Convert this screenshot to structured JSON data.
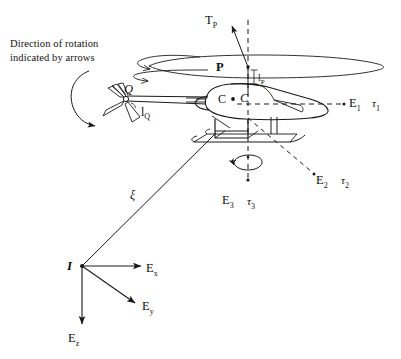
{
  "figure": {
    "title_note_line1": "Direction of rotation",
    "title_note_line2": "indicated by arrows",
    "background_color": "#ffffff",
    "line_color": "#1a1a1a"
  },
  "labels": {
    "thrust_main_rotor": "T",
    "thrust_main_rotor_sub": "P",
    "main_rotor_point": "P",
    "main_rotor_arm": "l",
    "main_rotor_arm_sub": "P",
    "tail_rotor_torque": "Q",
    "tail_rotor_arm": "l",
    "tail_rotor_arm_sub": "Q",
    "center_of_mass_left": "C",
    "center_of_mass_right": "C",
    "body_axis_1": "E",
    "body_axis_1_sub": "1",
    "body_torque_1": "τ",
    "body_torque_1_sub": "1",
    "body_axis_2": "E",
    "body_axis_2_sub": "2",
    "body_torque_2": "τ",
    "body_torque_2_sub": "2",
    "body_axis_3": "E",
    "body_axis_3_sub": "3",
    "body_torque_3": "τ",
    "body_torque_3_sub": "3",
    "position_vector": "ξ",
    "inertial_origin": "I",
    "inertial_axis_x": "E",
    "inertial_axis_x_sub": "x",
    "inertial_axis_y": "E",
    "inertial_axis_y_sub": "y",
    "inertial_axis_z": "E",
    "inertial_axis_z_sub": "z"
  }
}
